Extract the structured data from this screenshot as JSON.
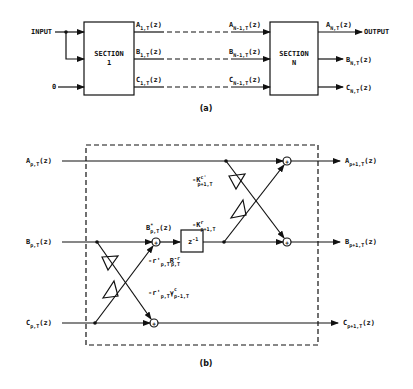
{
  "figure_a": {
    "caption": "(a)",
    "input_label": "INPUT",
    "zero_label": "0",
    "output_label": "OUTPUT",
    "section1": {
      "line1": "SECTION",
      "line2": "1"
    },
    "sectionN": {
      "line1": "SECTION",
      "line2": "N"
    },
    "signals_1": [
      {
        "base": "A",
        "sub": "1,T",
        "arg": "(z)"
      },
      {
        "base": "B",
        "sub": "1,T",
        "arg": "(z)"
      },
      {
        "base": "C",
        "sub": "1,T",
        "arg": "(z)"
      }
    ],
    "signals_N_minus_1": [
      {
        "base": "A",
        "sub": "N-1,T",
        "arg": "(z)"
      },
      {
        "base": "B",
        "sub": "N-1,T",
        "arg": "(z)"
      },
      {
        "base": "C",
        "sub": "N-1,T",
        "arg": "(z)"
      }
    ],
    "signals_N": [
      {
        "base": "A",
        "sub": "N,T",
        "arg": "(z)"
      },
      {
        "base": "B",
        "sub": "N,T",
        "arg": "(z)"
      },
      {
        "base": "C",
        "sub": "N,T",
        "arg": "(z)"
      }
    ]
  },
  "figure_b": {
    "caption": "(b)",
    "inputs": [
      {
        "base": "A",
        "sub": "p,T",
        "arg": "(z)"
      },
      {
        "base": "B",
        "sub": "p,T",
        "arg": "(z)"
      },
      {
        "base": "C",
        "sub": "p,T",
        "arg": "(z)"
      }
    ],
    "outputs": [
      {
        "base": "A",
        "sub": "p+1,T",
        "arg": "(z)"
      },
      {
        "base": "B",
        "sub": "p+1,T",
        "arg": "(z)"
      },
      {
        "base": "C",
        "sub": "p+1,T",
        "arg": "(z)"
      }
    ],
    "b_star": {
      "base": "B",
      "sup": "*",
      "sub": "p,T",
      "arg": "(z)"
    },
    "delay": {
      "base": "z",
      "sup": "-1"
    },
    "gain_kc": {
      "base": "-K",
      "sup": "c'",
      "sub": "p+1,T"
    },
    "gain_kr": {
      "base": "-K",
      "sup": "r",
      "sub": "p+1,T"
    },
    "gain_rR": {
      "pre": "-r'",
      "sub1": "p,T",
      "base2": "R",
      "sup2": "-r",
      "sub2": "p,T"
    },
    "gain_rY": {
      "pre": "-r'",
      "sub1": "p,T",
      "base2": "γ",
      "sup2": "c",
      "sub2": "p-1,T"
    },
    "summer_symbol": "+"
  }
}
